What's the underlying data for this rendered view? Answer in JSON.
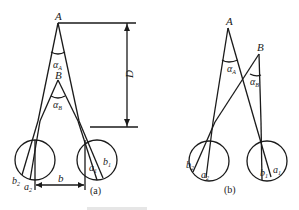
{
  "figure": {
    "panel_a": {
      "label": "(a)",
      "point_A": "A",
      "point_B": "B",
      "angle_A": "α",
      "angle_A_sub": "A",
      "angle_B": "α",
      "angle_B_sub": "B",
      "distance": "D",
      "baseline": "b",
      "retina_left_b": "b",
      "retina_left_b_sub": "2",
      "retina_left_a": "a",
      "retina_left_a_sub": "2",
      "retina_right_a": "a",
      "retina_right_a_sub": "1",
      "retina_right_b": "b",
      "retina_right_b_sub": "1"
    },
    "panel_b": {
      "label": "(b)",
      "point_A": "A",
      "point_B": "B",
      "angle_A": "α",
      "angle_A_sub": "A",
      "angle_B": "α",
      "angle_B_sub": "B",
      "retina_left_b": "b",
      "retina_left_b_sub": "2",
      "retina_left_a": "a",
      "retina_left_a_sub": "2",
      "retina_right_b": "b",
      "retina_right_b_sub": "1",
      "retina_right_a": "a",
      "retina_right_a_sub": "1"
    }
  }
}
